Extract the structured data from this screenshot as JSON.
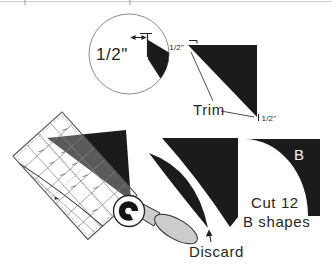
{
  "magnifier": {
    "measure_label": "1/2\""
  },
  "trim_step": {
    "top_corner_label": "1/2\"",
    "bottom_corner_label": "1/2\"",
    "callout_label": "Trim"
  },
  "cutting_step": {
    "discard_label": "Discard"
  },
  "result_step": {
    "piece_label": "B",
    "instruction_line1": "Cut 12",
    "instruction_line2": "B shapes"
  },
  "colors": {
    "shape_fill": "#1b1b1b",
    "cutter_handle": "#cccccc",
    "background": "#ffffff"
  }
}
